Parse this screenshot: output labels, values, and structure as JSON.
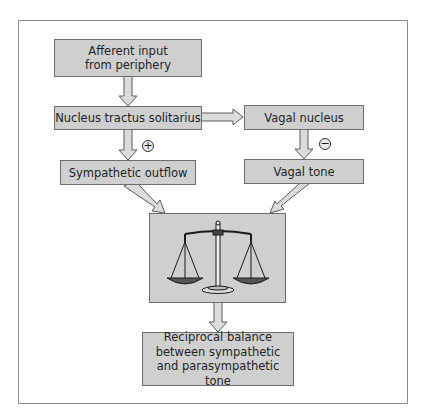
{
  "diagram": {
    "nodes": {
      "afferent": {
        "line1": "Afferent input",
        "line2": "from periphery"
      },
      "nts": {
        "label": "Nucleus tractus solitarius"
      },
      "vagal_nucleus": {
        "label": "Vagal nucleus"
      },
      "sympathetic_outflow": {
        "label": "Sympathetic outflow"
      },
      "vagal_tone": {
        "label": "Vagal tone"
      },
      "balance_icon": "scales-icon",
      "reciprocal": {
        "line1": "Reciprocal balance",
        "line2": "between sympathetic",
        "line3": "and parasympathetic tone"
      }
    },
    "signs": {
      "sympathetic": "+",
      "vagal": "−"
    },
    "edges": [
      {
        "from": "afferent",
        "to": "nts"
      },
      {
        "from": "nts",
        "to": "vagal_nucleus"
      },
      {
        "from": "nts",
        "to": "sympathetic_outflow",
        "sign": "+"
      },
      {
        "from": "vagal_nucleus",
        "to": "vagal_tone",
        "sign": "-"
      },
      {
        "from": "sympathetic_outflow",
        "to": "balance"
      },
      {
        "from": "vagal_tone",
        "to": "balance"
      },
      {
        "from": "balance",
        "to": "reciprocal"
      }
    ],
    "colors": {
      "box_fill": "#cfcfcf",
      "box_border": "#6e6e6e",
      "arrow_fill": "#d8d8d8",
      "arrow_stroke": "#5a5a5a"
    }
  }
}
